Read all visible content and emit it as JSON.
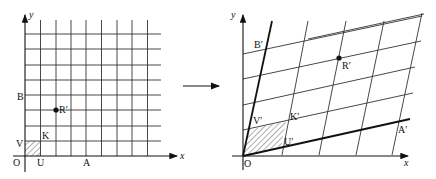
{
  "left_plot": {
    "axis_x_label": "x",
    "axis_y_label": "y",
    "points": {
      "O": "O",
      "U": "U",
      "A": "A",
      "V": "V",
      "K": "K",
      "B": "B",
      "R": "R′"
    },
    "grid": {
      "columns": 9,
      "rows": 8
    }
  },
  "arrow": {
    "direction": "right"
  },
  "right_plot": {
    "axis_x_label": "x",
    "axis_y_label": "y",
    "points": {
      "O": "O",
      "U": "U′",
      "A": "A′",
      "V": "V′",
      "K": "K′",
      "B": "B′",
      "R": "R′"
    }
  },
  "colors": {
    "ink": "#111111",
    "background": "#ffffff"
  }
}
